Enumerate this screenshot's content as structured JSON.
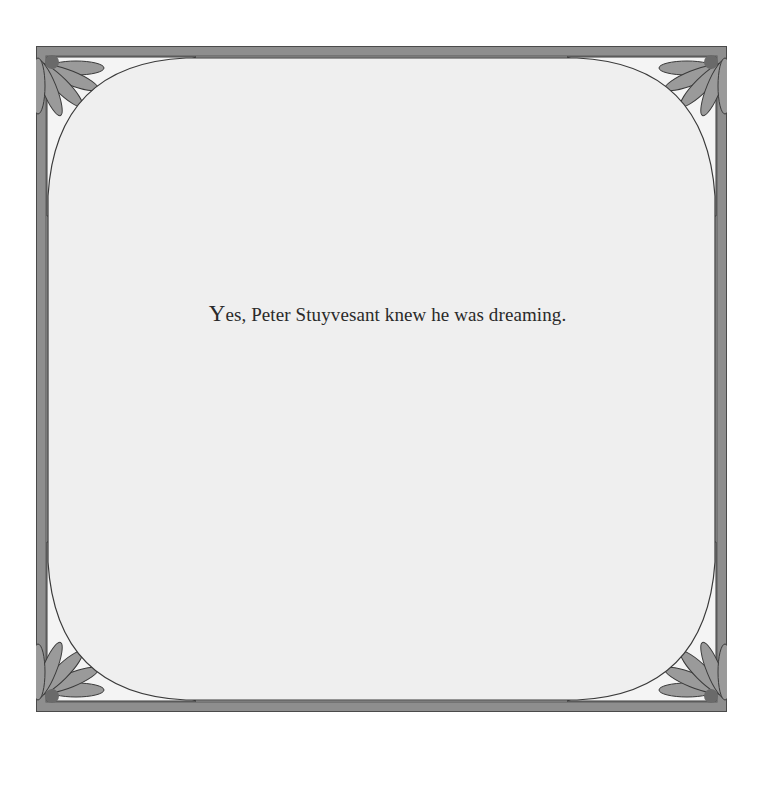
{
  "page": {
    "text_initial": "Y",
    "text_rest": "es, Peter Stuyvesant knew he was dreaming."
  },
  "colors": {
    "frame": "#8e8e8e",
    "frame_dark": "#5a5a5a",
    "panel": "#efefef",
    "petal": "#9a9a9a",
    "petal_light": "#f4f4f4"
  }
}
